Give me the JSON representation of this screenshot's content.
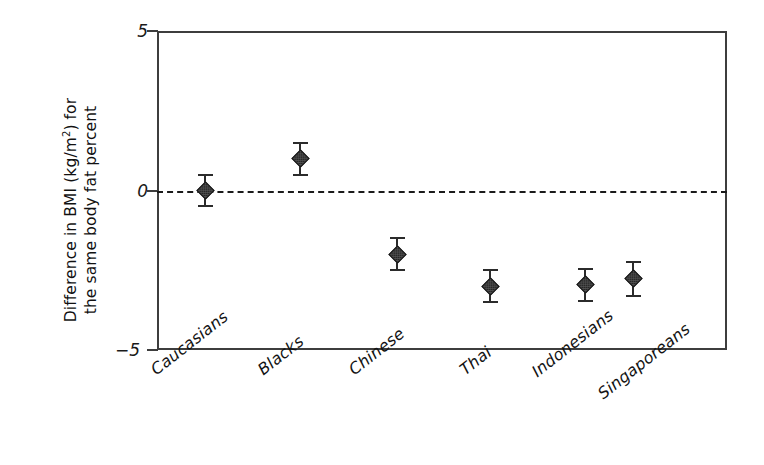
{
  "chart_data": {
    "type": "scatter",
    "title": "",
    "xlabel": "",
    "ylabel": "Difference in BMI (kg/m2) for the same body fat percent",
    "ylabel_lines": [
      "Difference in BMI (kg/m",
      "2",
      ") for",
      "the same body fat percent"
    ],
    "ylim": [
      -5,
      5
    ],
    "yticks": [
      5,
      0,
      -5
    ],
    "ytick_labels": [
      "5",
      "0",
      "-5"
    ],
    "grid": false,
    "legend": null,
    "zero_reference_line": {
      "value": 0,
      "style": "dashed",
      "color": "#1a1a1a"
    },
    "marker_style": "filled-diamond",
    "marker_color": "#4f4f4f",
    "errorbar_color": "#2b2b2b",
    "axis_color": "#3d3d3d",
    "categories": [
      "Caucasians",
      "Blacks",
      "Chinese",
      "Thai",
      "Indonesians",
      "Singaporeans"
    ],
    "values": [
      0.0,
      1.0,
      -2.0,
      -3.0,
      -2.95,
      -2.75
    ],
    "error_low": [
      -0.5,
      0.5,
      -2.5,
      -3.5,
      -3.45,
      -3.3
    ],
    "error_high": [
      0.5,
      1.5,
      -1.5,
      -2.5,
      -2.45,
      -2.25
    ],
    "points": [
      {
        "category": "Caucasians",
        "value": 0.0,
        "low": -0.5,
        "high": 0.5,
        "px_x": 205
      },
      {
        "category": "Blacks",
        "value": 1.0,
        "low": 0.5,
        "high": 1.5,
        "px_x": 300
      },
      {
        "category": "Chinese",
        "value": -2.0,
        "low": -2.5,
        "high": -1.5,
        "px_x": 397
      },
      {
        "category": "Thai",
        "value": -3.0,
        "low": -3.5,
        "high": -2.5,
        "px_x": 490
      },
      {
        "category": "Indonesians",
        "value": -2.95,
        "low": -3.45,
        "high": -2.45,
        "px_x": 585
      },
      {
        "category": "Singaporeans",
        "value": -2.75,
        "low": -3.3,
        "high": -2.25,
        "px_x": 633
      }
    ]
  },
  "axis": {
    "y_title_line1_pre": "Difference in BMI (kg/m",
    "y_title_line1_sup": "2",
    "y_title_line1_post": ") for",
    "y_title_line2": "the same body fat percent",
    "ytick_top": "5",
    "ytick_mid": "0",
    "ytick_bottom": "−5"
  }
}
